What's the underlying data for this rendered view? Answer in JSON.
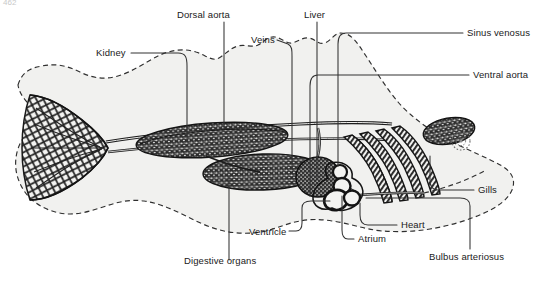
{
  "figure": {
    "folio": "462",
    "view": "lateral schematic",
    "colors": {
      "ink": "#1a1a1a",
      "body_fill": "#f1f1ef",
      "organ_dark": "#2b2b2b",
      "leader": "#333333",
      "page": "#ffffff"
    },
    "style": {
      "body_outline": "dashed",
      "organ_texture": "stipple-and-hatch",
      "label_font_size_px": 9.5
    }
  },
  "labels": [
    {
      "id": "kidney",
      "text": "Kidney",
      "x": 96,
      "y": 50,
      "align": "left",
      "anchor_x": 175,
      "anchor_y": 57
    },
    {
      "id": "dorsal-aorta",
      "text": "Dorsal aorta",
      "x": 177,
      "y": 10,
      "align": "left",
      "anchor_x": 223,
      "anchor_y": 22
    },
    {
      "id": "veins",
      "text": "Veins",
      "x": 253,
      "y": 36,
      "align": "left",
      "anchor_x": 287,
      "anchor_y": 42
    },
    {
      "id": "liver",
      "text": "Liver",
      "x": 305,
      "y": 10,
      "align": "left",
      "anchor_x": 317,
      "anchor_y": 22
    },
    {
      "id": "sinus-venosus",
      "text": "Sinus venosus",
      "x": 466,
      "y": 28,
      "align": "left",
      "anchor_x": 462,
      "anchor_y": 33
    },
    {
      "id": "ventral-aorta",
      "text": "Ventral aorta",
      "x": 472,
      "y": 70,
      "align": "left",
      "anchor_x": 468,
      "anchor_y": 75
    },
    {
      "id": "gills",
      "text": "Gills",
      "x": 477,
      "y": 185,
      "align": "left",
      "anchor_x": 473,
      "anchor_y": 190
    },
    {
      "id": "heart",
      "text": "Heart",
      "x": 400,
      "y": 220,
      "align": "left",
      "anchor_x": 396,
      "anchor_y": 225
    },
    {
      "id": "atrium",
      "text": "Atrium",
      "x": 357,
      "y": 234,
      "align": "left",
      "anchor_x": 353,
      "anchor_y": 239
    },
    {
      "id": "bulbus-arteriosus",
      "text": "Bulbus arteriosus",
      "x": 428,
      "y": 252,
      "align": "left",
      "anchor_x": 424,
      "anchor_y": 257
    },
    {
      "id": "ventricle",
      "text": "Ventricle",
      "x": 250,
      "y": 228,
      "align": "left",
      "anchor_x": 246,
      "anchor_y": 233
    },
    {
      "id": "digestive-organs",
      "text": "Digestive organs",
      "x": 185,
      "y": 263,
      "align": "left",
      "anchor_x": 181,
      "anchor_y": 268
    }
  ],
  "structures": [
    {
      "id": "tail-caudal-network",
      "name": "caudal fin vascular network"
    },
    {
      "id": "kidney-mass",
      "name": "kidney"
    },
    {
      "id": "liver-mass",
      "name": "liver"
    },
    {
      "id": "spleen-mass",
      "name": "spleen / digestive mass"
    },
    {
      "id": "gill-arches",
      "name": "gill arches",
      "count": 4
    },
    {
      "id": "heart-chambers",
      "name": "heart (atrium, ventricle, bulbus arteriosus)"
    },
    {
      "id": "eye",
      "name": "eye"
    },
    {
      "id": "dorsal-aorta-vessel",
      "name": "dorsal aorta"
    },
    {
      "id": "ventral-aorta-vessel",
      "name": "ventral aorta"
    },
    {
      "id": "body-outline",
      "name": "fish body silhouette"
    }
  ]
}
